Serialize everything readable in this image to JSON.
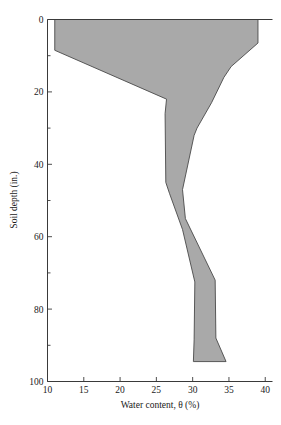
{
  "chart_data": {
    "type": "area",
    "title": "",
    "xlabel": "Water content, θ (%)",
    "ylabel": "Soil depth (in.)",
    "xlim": [
      10,
      41
    ],
    "ylim": [
      0,
      100
    ],
    "y_inverted": true,
    "grid": false,
    "legend": null,
    "x_ticks": [
      10,
      15,
      20,
      25,
      30,
      35,
      40
    ],
    "x_tick_labels": [
      "10",
      "15",
      "20",
      "25",
      "30",
      "35",
      "40"
    ],
    "y_ticks": [
      0,
      20,
      40,
      60,
      80,
      100
    ],
    "y_tick_labels": [
      "0",
      "20",
      "40",
      "60",
      "80",
      "100"
    ],
    "y_minor_ticks": [
      10,
      30,
      50,
      70,
      90
    ],
    "fill_color": "#a9a9a9",
    "line_color": "#4a4a4a",
    "axis_color": "#3a3a3a",
    "series": [
      {
        "name": "lower_bound_water_content",
        "points": [
          {
            "depth": 0,
            "theta": 11.0
          },
          {
            "depth": 8.5,
            "theta": 11.0
          },
          {
            "depth": 22.0,
            "theta": 26.4
          },
          {
            "depth": 26.0,
            "theta": 26.2
          },
          {
            "depth": 45.0,
            "theta": 26.3
          },
          {
            "depth": 48.0,
            "theta": 26.8
          },
          {
            "depth": 58.0,
            "theta": 28.6
          },
          {
            "depth": 72.5,
            "theta": 30.3
          },
          {
            "depth": 88.5,
            "theta": 30.2
          },
          {
            "depth": 94.5,
            "theta": 30.1
          }
        ]
      },
      {
        "name": "upper_bound_water_content",
        "points": [
          {
            "depth": 0,
            "theta": 39.0
          },
          {
            "depth": 6.5,
            "theta": 39.0
          },
          {
            "depth": 13.0,
            "theta": 35.3
          },
          {
            "depth": 16.0,
            "theta": 34.3
          },
          {
            "depth": 23.0,
            "theta": 32.6
          },
          {
            "depth": 30.0,
            "theta": 30.6
          },
          {
            "depth": 32.0,
            "theta": 30.2
          },
          {
            "depth": 47.0,
            "theta": 28.6
          },
          {
            "depth": 55.0,
            "theta": 29.0
          },
          {
            "depth": 72.0,
            "theta": 33.1
          },
          {
            "depth": 88.0,
            "theta": 33.2
          },
          {
            "depth": 94.5,
            "theta": 34.6
          }
        ]
      }
    ]
  }
}
